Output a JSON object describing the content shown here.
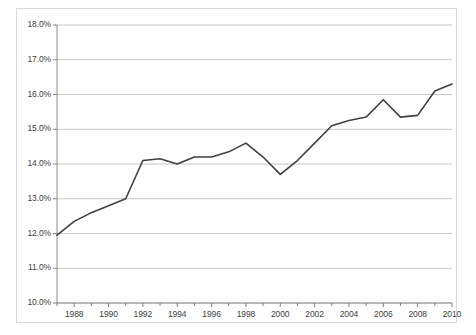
{
  "chart_data": {
    "type": "line",
    "title": "",
    "subtitle": "",
    "xlabel": "",
    "ylabel": "",
    "xlim": [
      1987,
      2010
    ],
    "ylim": [
      10.0,
      18.0
    ],
    "grid": true,
    "legend": false,
    "legend_position": "none",
    "line_color": "#404040",
    "gridline_color": "#c8c8c8",
    "axis_color": "#808080",
    "background_color": "#ffffff",
    "y_tick_labels": [
      "18.0%",
      "17.0%",
      "16.0%",
      "15.0%",
      "14.0%",
      "13.0%",
      "12.0%",
      "11.0%",
      "10.0%"
    ],
    "y_tick_values": [
      18.0,
      17.0,
      16.0,
      15.0,
      14.0,
      13.0,
      12.0,
      11.0,
      10.0
    ],
    "x_tick_labels": [
      "1988",
      "1990",
      "1992",
      "1994",
      "1996",
      "1998",
      "2000",
      "2002",
      "2004",
      "2006",
      "2008",
      "2010"
    ],
    "x_tick_values": [
      1988,
      1990,
      1992,
      1994,
      1996,
      1998,
      2000,
      2002,
      2004,
      2006,
      2008,
      2010
    ],
    "x_minor_ticks": [
      1987,
      1989,
      1991,
      1993,
      1995,
      1997,
      1999,
      2001,
      2003,
      2005,
      2007,
      2009
    ],
    "x": [
      1987,
      1988,
      1989,
      1990,
      1991,
      1992,
      1993,
      1994,
      1995,
      1996,
      1997,
      1998,
      1999,
      2000,
      2001,
      2002,
      2003,
      2004,
      2005,
      2006,
      2007,
      2008,
      2009,
      2010
    ],
    "values": [
      11.95,
      12.35,
      12.6,
      12.8,
      13.0,
      14.1,
      14.15,
      14.0,
      14.2,
      14.2,
      14.35,
      14.6,
      14.2,
      13.7,
      14.1,
      14.6,
      15.1,
      15.25,
      15.35,
      15.85,
      15.35,
      15.4,
      16.1,
      16.3
    ],
    "series": [
      {
        "name": "",
        "values": [
          11.95,
          12.35,
          12.6,
          12.8,
          13.0,
          14.1,
          14.15,
          14.0,
          14.2,
          14.2,
          14.35,
          14.6,
          14.2,
          13.7,
          14.1,
          14.6,
          15.1,
          15.25,
          15.35,
          15.85,
          15.35,
          15.4,
          16.1,
          16.3
        ]
      }
    ]
  }
}
